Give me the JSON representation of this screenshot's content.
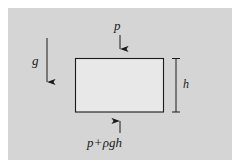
{
  "figure": {
    "background_color": "#d5d5d5",
    "outer_color": "#ffffff",
    "line_color": "#1a1a1a"
  },
  "element": {
    "name": "fluid-element-rectangle",
    "fill_color": "#e8e8e8",
    "stroke_color": "#1a1a1a",
    "x": 75,
    "y": 58,
    "width": 89,
    "height": 54
  },
  "labels": {
    "top_pressure": "p",
    "gravity": "g",
    "height": "h",
    "bottom_pressure_term1": "p",
    "bottom_pressure_operator": "+",
    "bottom_pressure_term2": "ρgh"
  },
  "arrows": {
    "top_pressure_arrow": {
      "name": "downward-arrow-top",
      "direction": "down",
      "x": 120,
      "y_start": 35,
      "y_end": 57
    },
    "bottom_pressure_arrow": {
      "name": "upward-arrow-bottom",
      "direction": "up",
      "x": 120,
      "y_start": 133,
      "y_end": 113
    },
    "gravity_arrow": {
      "name": "downward-arrow-gravity",
      "direction": "down",
      "x": 47,
      "y_start": 38,
      "y_end": 90
    }
  },
  "dimension": {
    "name": "height-dimension-line",
    "x": 176,
    "y_top": 58,
    "y_bottom": 112,
    "cap_half_width": 4
  }
}
